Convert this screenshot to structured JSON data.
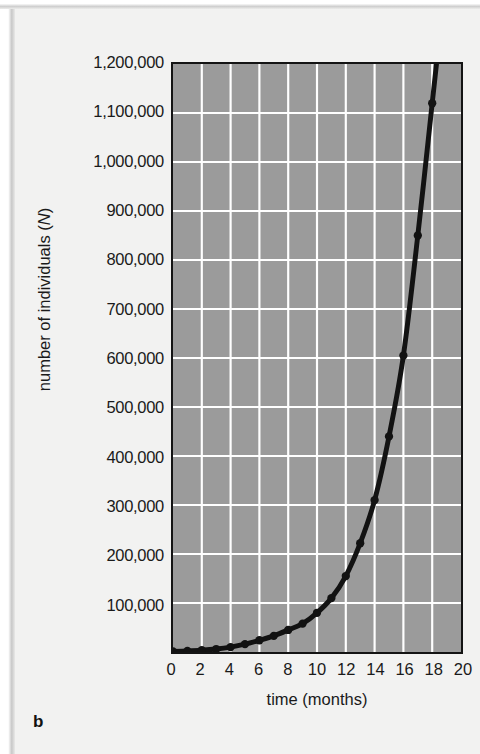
{
  "figure": {
    "panel_label": "b",
    "background_color": "#f2f2f1",
    "plot_background_color": "#9b9b9b",
    "gridline_color": "#ffffff",
    "curve_color": "#121212",
    "axis_color": "#141414"
  },
  "axes": {
    "x_title": "time (months)",
    "y_title_prefix": "number of individuals (",
    "y_title_symbol": "N",
    "y_title_suffix": ")"
  },
  "chart_data": {
    "type": "line",
    "title": "",
    "subtitle": "",
    "xlabel": "time (months)",
    "ylabel": "number of individuals (N)",
    "xlim": [
      0,
      20
    ],
    "ylim": [
      0,
      1200000
    ],
    "grid": true,
    "legend": "none",
    "x_ticks": [
      0,
      2,
      4,
      6,
      8,
      10,
      12,
      14,
      16,
      18,
      20
    ],
    "x_tick_labels": [
      "0",
      "2",
      "4",
      "6",
      "8",
      "10",
      "12",
      "14",
      "16",
      "18",
      "20"
    ],
    "y_ticks": [
      100000,
      200000,
      300000,
      400000,
      500000,
      600000,
      700000,
      800000,
      900000,
      1000000,
      1100000,
      1200000
    ],
    "y_tick_labels": [
      "100,000",
      "200,000",
      "300,000",
      "400,000",
      "500,000",
      "600,000",
      "700,000",
      "800,000",
      "900,000",
      "1,000,000",
      "1,100,000",
      "1,200,000"
    ],
    "x_gridline_step": 2,
    "y_gridline_step": 100000,
    "series": [
      {
        "name": "population",
        "marker": "filled-circle",
        "x": [
          0,
          1,
          2,
          3,
          4,
          5,
          6,
          7,
          8,
          9,
          10,
          11,
          12,
          13,
          14,
          15,
          16,
          17,
          18
        ],
        "values": [
          1000,
          2000,
          3500,
          6000,
          10000,
          16000,
          24000,
          33000,
          45000,
          58000,
          80000,
          110000,
          155000,
          222000,
          310000,
          440000,
          605000,
          850000,
          1120000
        ]
      }
    ]
  }
}
